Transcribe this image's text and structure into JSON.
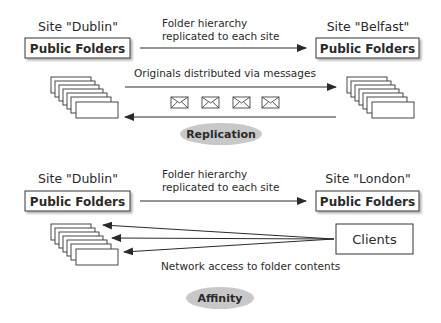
{
  "replication": {
    "left_site": {
      "title": "Site \"Dublin\"",
      "box_label": "Public Folders"
    },
    "right_site": {
      "title": "Site \"Belfast\"",
      "box_label": "Public Folders"
    },
    "hierarchy_note": {
      "line1": "Folder hierarchy",
      "line2": "replicated to each site"
    },
    "messages_note": "Originals distributed via messages",
    "message_icons": [
      "envelope-icon",
      "envelope-icon",
      "envelope-icon",
      "envelope-icon"
    ],
    "badge": "Replication"
  },
  "affinity": {
    "left_site": {
      "title": "Site \"Dublin\"",
      "box_label": "Public Folders"
    },
    "right_site": {
      "title": "Site \"London\"",
      "box_label": "Public Folders"
    },
    "hierarchy_note": {
      "line1": "Folder hierarchy",
      "line2": "replicated to each site"
    },
    "clients_label": "Clients",
    "network_note": "Network access to folder contents",
    "badge": "Affinity"
  },
  "colors": {
    "line": "#2a2a2a",
    "badge_fill": "#c8c8c8",
    "shadow": "#9a9a9a"
  }
}
